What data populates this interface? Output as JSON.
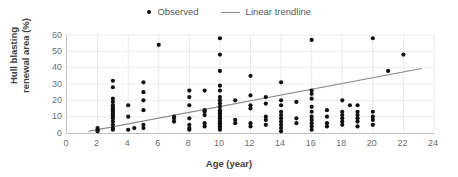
{
  "chart_data": {
    "type": "scatter",
    "title": "",
    "xlabel": "Age (year)",
    "ylabel": "Hull blasting\nrenewal area (%)",
    "ylabel_line1": "Hull blasting",
    "ylabel_line2": "renewal area (%)",
    "xlim": [
      0,
      24
    ],
    "ylim": [
      0,
      60
    ],
    "xticks": [
      0,
      2,
      4,
      6,
      8,
      10,
      12,
      14,
      16,
      18,
      20,
      22,
      24
    ],
    "yticks": [
      0,
      10,
      20,
      30,
      40,
      50,
      60
    ],
    "grid": "horizontal-and-vertical-light",
    "legend_position": "top-center",
    "legend": [
      {
        "label": "Observed",
        "marker": "dot",
        "color": "#111111"
      },
      {
        "label": "Linear trendline",
        "marker": "line",
        "color": "#8a8a8a"
      }
    ],
    "series": [
      {
        "name": "Observed",
        "marker": "dot",
        "color": "#111111",
        "points": [
          [
            2,
            1
          ],
          [
            2,
            2
          ],
          [
            2,
            3
          ],
          [
            3,
            2
          ],
          [
            3,
            3
          ],
          [
            3,
            5
          ],
          [
            3,
            7
          ],
          [
            3,
            9
          ],
          [
            3,
            10
          ],
          [
            3,
            11
          ],
          [
            3,
            12
          ],
          [
            3,
            13
          ],
          [
            3,
            14
          ],
          [
            3,
            15
          ],
          [
            3,
            16
          ],
          [
            3,
            17
          ],
          [
            3,
            19
          ],
          [
            3,
            21
          ],
          [
            3,
            28
          ],
          [
            3,
            32
          ],
          [
            4,
            2
          ],
          [
            4,
            10
          ],
          [
            4,
            17
          ],
          [
            4.4,
            3
          ],
          [
            5,
            3
          ],
          [
            5,
            5
          ],
          [
            5,
            14
          ],
          [
            5,
            20
          ],
          [
            5,
            25
          ],
          [
            5,
            31
          ],
          [
            6,
            54
          ],
          [
            7,
            7
          ],
          [
            7,
            9
          ],
          [
            7,
            10
          ],
          [
            8,
            2
          ],
          [
            8,
            3
          ],
          [
            8,
            5
          ],
          [
            8,
            9
          ],
          [
            8,
            17
          ],
          [
            8,
            22
          ],
          [
            8,
            26
          ],
          [
            9,
            4
          ],
          [
            9,
            6
          ],
          [
            9,
            11
          ],
          [
            9,
            13
          ],
          [
            9,
            14
          ],
          [
            9,
            26
          ],
          [
            10,
            2
          ],
          [
            10,
            3
          ],
          [
            10,
            4
          ],
          [
            10,
            5
          ],
          [
            10,
            6
          ],
          [
            10,
            7
          ],
          [
            10,
            8
          ],
          [
            10,
            9
          ],
          [
            10,
            10
          ],
          [
            10,
            11
          ],
          [
            10,
            12
          ],
          [
            10,
            13
          ],
          [
            10,
            14
          ],
          [
            10,
            16
          ],
          [
            10,
            18
          ],
          [
            10,
            20
          ],
          [
            10,
            22
          ],
          [
            10,
            26
          ],
          [
            10,
            29
          ],
          [
            10,
            38
          ],
          [
            10,
            48
          ],
          [
            10,
            58
          ],
          [
            11,
            6
          ],
          [
            11,
            8
          ],
          [
            11,
            20
          ],
          [
            12,
            4
          ],
          [
            12,
            6
          ],
          [
            12,
            15
          ],
          [
            12,
            17
          ],
          [
            12,
            23
          ],
          [
            12,
            35
          ],
          [
            13,
            5
          ],
          [
            13,
            8
          ],
          [
            13,
            10
          ],
          [
            13,
            18
          ],
          [
            13,
            22
          ],
          [
            14,
            1
          ],
          [
            14,
            3
          ],
          [
            14,
            5
          ],
          [
            14,
            7
          ],
          [
            14,
            9
          ],
          [
            14,
            11
          ],
          [
            14,
            13
          ],
          [
            14,
            17
          ],
          [
            14,
            20
          ],
          [
            14,
            31
          ],
          [
            15,
            6
          ],
          [
            15,
            9
          ],
          [
            15,
            19
          ],
          [
            16,
            2
          ],
          [
            16,
            4
          ],
          [
            16,
            6
          ],
          [
            16,
            8
          ],
          [
            16,
            10
          ],
          [
            16,
            13
          ],
          [
            16,
            16
          ],
          [
            16,
            21
          ],
          [
            16,
            24
          ],
          [
            16,
            26
          ],
          [
            16,
            57
          ],
          [
            17,
            4
          ],
          [
            17,
            6
          ],
          [
            17,
            10
          ],
          [
            17,
            14
          ],
          [
            18,
            5
          ],
          [
            18,
            7
          ],
          [
            18,
            9
          ],
          [
            18,
            11
          ],
          [
            18,
            13
          ],
          [
            18,
            20
          ],
          [
            19,
            4
          ],
          [
            19,
            7
          ],
          [
            19,
            9
          ],
          [
            19,
            11
          ],
          [
            19,
            13
          ],
          [
            19,
            17
          ],
          [
            20,
            5
          ],
          [
            20,
            8
          ],
          [
            20,
            10
          ],
          [
            20,
            13
          ],
          [
            20,
            58
          ],
          [
            21,
            38
          ],
          [
            22,
            48
          ],
          [
            18.5,
            17
          ]
        ]
      }
    ],
    "trendline": {
      "name": "Linear trendline",
      "color": "#8a8a8a",
      "x_start": 1.4,
      "y_start": 1.0,
      "x_end": 23.2,
      "y_end": 39.5
    }
  }
}
